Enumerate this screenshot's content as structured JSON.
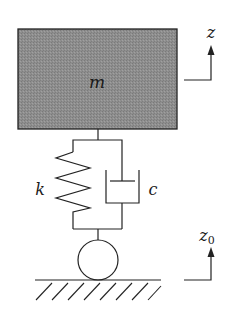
{
  "diagram": {
    "mass": {
      "label": "m",
      "fill": "#8c8c8c",
      "stroke": "#222222"
    },
    "spring": {
      "label": "k"
    },
    "damper": {
      "label": "c"
    },
    "wheel": {
      "label": ""
    },
    "ground": {
      "label": ""
    },
    "displacement_body": {
      "label": "z"
    },
    "displacement_ground": {
      "label": "z",
      "subscript": "0"
    }
  },
  "colors": {
    "line": "#222222",
    "mass_fill": "#8c8c8c",
    "background": "#ffffff"
  }
}
